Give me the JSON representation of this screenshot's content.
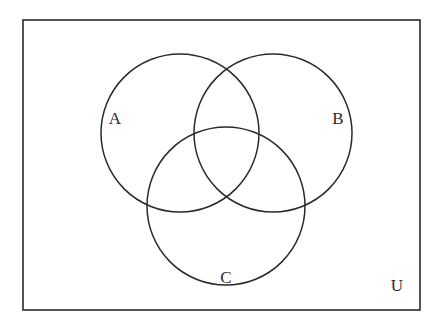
{
  "diagram": {
    "type": "venn",
    "universe": {
      "label": "U",
      "rect": {
        "x": 23,
        "y": 20,
        "width": 397,
        "height": 290
      }
    },
    "sets": [
      {
        "label": "A",
        "cx": 180,
        "cy": 133,
        "r": 79,
        "label_x": 115,
        "label_y": 124
      },
      {
        "label": "B",
        "cx": 273,
        "cy": 133,
        "r": 79,
        "label_x": 338,
        "label_y": 124
      },
      {
        "label": "C",
        "cx": 226,
        "cy": 206,
        "r": 79,
        "label_x": 226,
        "label_y": 283
      }
    ],
    "universe_label_pos": {
      "x": 397,
      "y": 291
    },
    "stroke_color": "#2a2a2a",
    "background_color": "#ffffff"
  }
}
